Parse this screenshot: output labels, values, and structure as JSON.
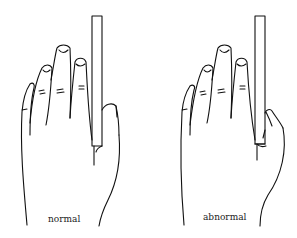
{
  "figure": {
    "panels": [
      {
        "id": "normal",
        "label": "normal",
        "description": "hand holding card with thumb flexed normally"
      },
      {
        "id": "abnormal",
        "label": "abnormal",
        "description": "hand holding card with thumb IP joint flexion (Froment-like sign)"
      }
    ],
    "colors": {
      "stroke": "#111111",
      "background": "#ffffff"
    }
  }
}
